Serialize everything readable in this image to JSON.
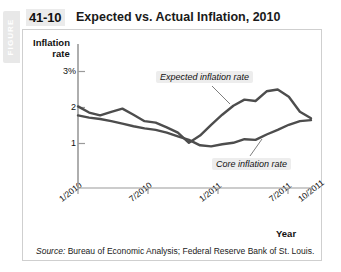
{
  "figure": {
    "tab_label": "FIGURE",
    "number": "41-10",
    "title": "Expected vs. Actual Inflation, 2010"
  },
  "source": {
    "prefix": "Source:",
    "text": " Bureau of Economic Analysis; Federal Reserve Bank of St. Louis."
  },
  "chart_data": {
    "type": "line",
    "title": "Expected vs. Actual Inflation, 2010",
    "xlabel": "Year",
    "ylabel": "Inflation rate",
    "ylim": [
      0.55,
      3.15
    ],
    "xlim": [
      0,
      21
    ],
    "grid": false,
    "legend_position": "inline-annotations",
    "ytick_labels": [
      "3%",
      "2",
      "1"
    ],
    "ytick_values": [
      3,
      2,
      1
    ],
    "xtick_labels": [
      "1/2010",
      "7/2010",
      "1/2011",
      "7/2011",
      "10/2011"
    ],
    "xtick_values": [
      0,
      6,
      12,
      18,
      21
    ],
    "series": [
      {
        "name": "Expected inflation rate",
        "color": "#4d4d4d",
        "x": [
          0,
          1,
          2,
          3,
          4,
          5,
          6,
          7,
          8,
          9,
          10,
          11,
          12,
          13,
          14,
          15,
          16,
          17,
          18,
          19,
          20,
          21
        ],
        "values": [
          2.03,
          1.86,
          1.78,
          1.88,
          1.97,
          1.8,
          1.62,
          1.58,
          1.45,
          1.3,
          1.02,
          1.22,
          1.52,
          1.8,
          2.05,
          2.22,
          2.18,
          2.45,
          2.5,
          2.3,
          1.88,
          1.7
        ]
      },
      {
        "name": "Core inflation rate",
        "color": "#4d4d4d",
        "x": [
          0,
          1,
          2,
          3,
          4,
          5,
          6,
          7,
          8,
          9,
          10,
          11,
          12,
          13,
          14,
          15,
          16,
          17,
          18,
          19,
          20,
          21
        ],
        "values": [
          1.78,
          1.72,
          1.68,
          1.62,
          1.55,
          1.48,
          1.42,
          1.38,
          1.3,
          1.2,
          1.1,
          0.95,
          0.92,
          0.98,
          1.02,
          1.12,
          1.1,
          1.25,
          1.38,
          1.52,
          1.62,
          1.65
        ]
      }
    ],
    "annotations": [
      {
        "label": "Expected inflation rate",
        "anchor_x": 15,
        "anchor_y": 2.22
      },
      {
        "label": "Core inflation rate",
        "anchor_x": 17,
        "anchor_y": 1.25
      }
    ]
  }
}
